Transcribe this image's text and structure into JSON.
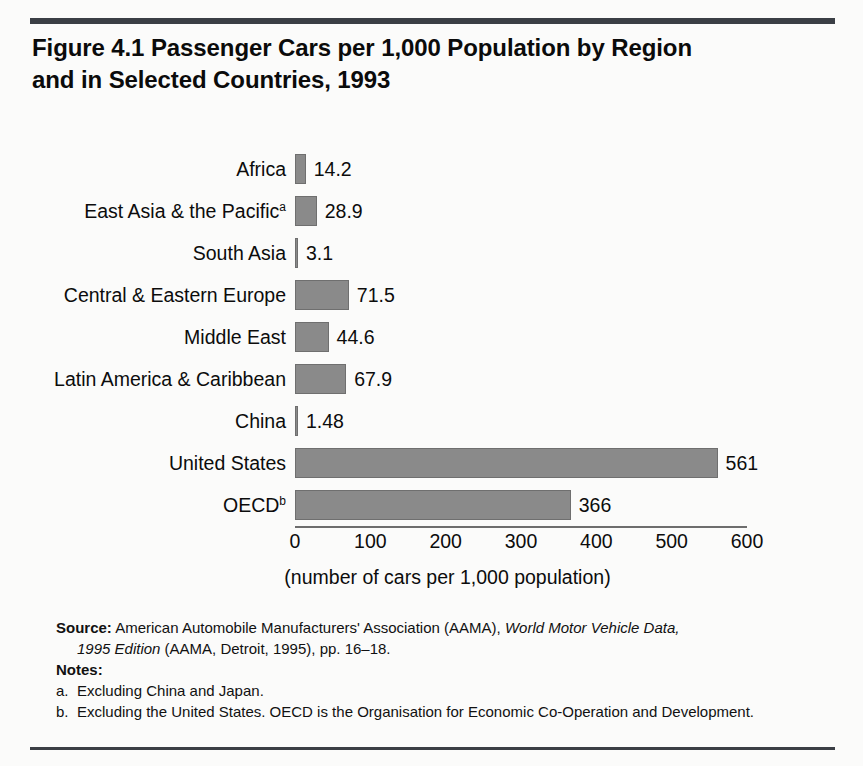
{
  "figure": {
    "title": "Figure 4.1  Passenger Cars per 1,000 Population by Region and in Selected Countries, 1993"
  },
  "chart_data": {
    "type": "bar",
    "orientation": "horizontal",
    "title": "Figure 4.1  Passenger Cars per 1,000 Population by Region and in Selected Countries, 1993",
    "xlabel": "(number of cars per 1,000 population)",
    "ylabel": "",
    "categories": [
      "Africa",
      "East Asia & the Pacific",
      "South Asia",
      "Central & Eastern Europe",
      "Middle East",
      "Latin America & Caribbean",
      "China",
      "United States",
      "OECD"
    ],
    "category_superscripts": [
      "",
      "a",
      "",
      "",
      "",
      "",
      "",
      "",
      "b"
    ],
    "values": [
      14.2,
      28.9,
      3.1,
      71.5,
      44.6,
      67.9,
      1.48,
      561,
      366
    ],
    "value_labels": [
      "14.2",
      "28.9",
      "3.1",
      "71.5",
      "44.6",
      "67.9",
      "1.48",
      "561",
      "366"
    ],
    "xlim": [
      0,
      600
    ],
    "xticks": [
      0,
      100,
      200,
      300,
      400,
      500,
      600
    ],
    "xtick_labels": [
      "0",
      "100",
      "200",
      "300",
      "400",
      "500",
      "600"
    ],
    "grid": false,
    "legend": false,
    "bar_color": "#8a8a8a",
    "bar_edge_color": "#6f6f6f"
  },
  "source": {
    "label": "Source:",
    "line1_a": " American Automobile Manufacturers' Association (AAMA), ",
    "line1_italic": "World Motor Vehicle Data,",
    "line2_italic": "1995 Edition",
    "line2_b": " (AAMA, Detroit, 1995), pp. 16–18."
  },
  "notes": {
    "heading": "Notes:",
    "items": [
      {
        "marker": "a.",
        "text": "Excluding China and Japan."
      },
      {
        "marker": "b.",
        "text": "Excluding the United States. OECD is the Organisation for Economic Co-Operation and Development."
      }
    ]
  }
}
